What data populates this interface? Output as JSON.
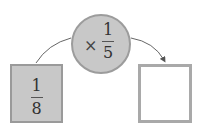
{
  "operation": {
    "operator_symbol": "×",
    "numerator": "1",
    "denominator": "5"
  },
  "input_box": {
    "numerator": "1",
    "denominator": "8"
  },
  "output_box": {
    "value": ""
  },
  "colors": {
    "fill": "#c8c8c8",
    "border": "#9a9a9a",
    "arrow": "#555555"
  }
}
